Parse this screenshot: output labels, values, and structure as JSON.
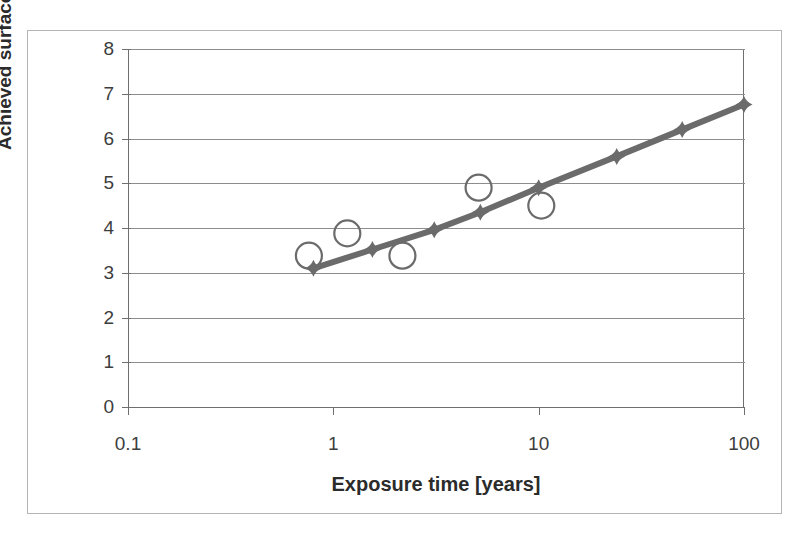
{
  "chart_data": {
    "type": "scatter",
    "title": "",
    "subtitle": "",
    "xlabel": "Exposure time [years]",
    "ylabel": "Achieved surface chloride Csa",
    "ylabel_main": "Achieved surface chloride ",
    "ylabel_symbol": "C",
    "ylabel_subscript": "sa",
    "xscale": "log",
    "yscale": "linear",
    "xlim": [
      0.1,
      100
    ],
    "ylim": [
      0,
      8
    ],
    "xticks": [
      0.1,
      1,
      10,
      100
    ],
    "xtick_labels": [
      "0.1",
      "1",
      "10",
      "100"
    ],
    "yticks": [
      0,
      1,
      2,
      3,
      4,
      5,
      6,
      7,
      8
    ],
    "ytick_labels": [
      "0",
      "1",
      "2",
      "3",
      "4",
      "5",
      "6",
      "7",
      "8"
    ],
    "grid": "horizontal",
    "legend": "none",
    "series": [
      {
        "name": "Measured data",
        "marker": "open-circle",
        "color": "#6b6b6b",
        "line": "none",
        "points": [
          {
            "x": 0.76,
            "y": 3.38
          },
          {
            "x": 1.17,
            "y": 3.88
          },
          {
            "x": 2.17,
            "y": 3.38
          },
          {
            "x": 5.1,
            "y": 4.9
          },
          {
            "x": 10.3,
            "y": 4.5
          }
        ]
      },
      {
        "name": "Model prediction",
        "marker": "filled-diamond",
        "color": "#6b6b6b",
        "line": "solid",
        "points": [
          {
            "x": 0.8,
            "y": 3.1
          },
          {
            "x": 1.55,
            "y": 3.52
          },
          {
            "x": 3.1,
            "y": 3.96
          },
          {
            "x": 5.2,
            "y": 4.35
          },
          {
            "x": 10.0,
            "y": 4.9
          },
          {
            "x": 24.0,
            "y": 5.6
          },
          {
            "x": 50.0,
            "y": 6.2
          },
          {
            "x": 100.0,
            "y": 6.76
          }
        ]
      }
    ]
  },
  "style": {
    "axis_color": "#6f6f6f",
    "grid_color": "#8d8d8d",
    "series_color": "#6b6b6b",
    "frame_color": "#b5b5b5",
    "text_color": "#3d3d3d",
    "background": "#ffffff"
  }
}
